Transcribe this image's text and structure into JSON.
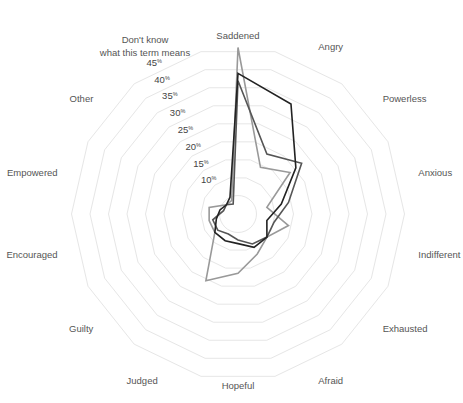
{
  "chart_data": {
    "type": "radar",
    "title": "",
    "categories": [
      "Saddened",
      "Angry",
      "Powerless",
      "Anxious",
      "Indifferent",
      "Exhausted",
      "Afraid",
      "Hopeful",
      "Judged",
      "Guilty",
      "Encouraged",
      "Empowered",
      "Other",
      "Don't know what this term means"
    ],
    "rlim": [
      0,
      45
    ],
    "ticks": [
      10,
      15,
      20,
      25,
      30,
      35,
      40,
      45
    ],
    "tick_suffix": "%",
    "grid": true,
    "series": [
      {
        "name": "Series 1",
        "color": "#222222",
        "values": [
          38,
          33,
          20,
          12,
          8,
          10,
          10,
          8,
          8,
          8,
          6,
          5,
          4,
          5
        ]
      },
      {
        "name": "Series 2",
        "color": "#555555",
        "values": [
          36,
          18,
          22,
          14,
          10,
          10,
          9,
          7,
          6,
          7,
          7,
          4,
          4,
          3
        ]
      },
      {
        "name": "Series 3",
        "color": "#999999",
        "values": [
          45,
          14,
          18,
          8,
          14,
          10,
          12,
          16,
          20,
          8,
          8,
          8,
          4,
          4
        ]
      }
    ]
  },
  "labels": {
    "dont_know_line1": "Don't know",
    "dont_know_line2": "what this term means"
  }
}
